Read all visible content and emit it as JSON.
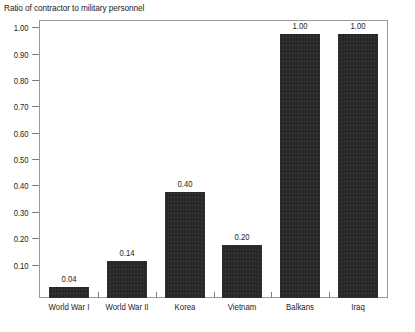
{
  "chart_data": {
    "type": "bar",
    "title": "Ratio of contractor to military personnel",
    "xlabel": "",
    "ylabel": "",
    "categories": [
      "World War I",
      "World War II",
      "Korea",
      "Vietnam",
      "Balkans",
      "Iraq"
    ],
    "values": [
      0.04,
      0.14,
      0.4,
      0.2,
      1.0,
      1.0
    ],
    "value_labels": [
      "0.04",
      "0.14",
      "0.40",
      "0.20",
      "1.00",
      "1.00"
    ],
    "ylim": [
      0.0,
      1.05
    ],
    "y_ticks": [
      1.0,
      0.9,
      0.8,
      0.7,
      0.6,
      0.5,
      0.4,
      0.3,
      0.2,
      0.1
    ],
    "y_tick_labels": [
      "1.00",
      "0.90",
      "0.80",
      "0.70",
      "0.60",
      "0.50",
      "0.40",
      "0.30",
      "0.20",
      "0.10"
    ],
    "grid": false,
    "legend": "none",
    "bar_color": "#262626",
    "frame_color": "#9a9a9a",
    "text_color": "#1c1c1c"
  }
}
